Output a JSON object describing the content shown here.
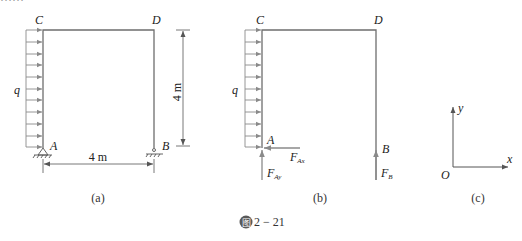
{
  "figure": {
    "caption_number": "2 − 21",
    "caption_badge": "图",
    "top_text_cropped": "……"
  },
  "panel_a": {
    "label": "(a)",
    "nodes": {
      "C": "C",
      "D": "D",
      "A": "A",
      "B": "B"
    },
    "load_label": "q",
    "height_dim": "4 m",
    "width_dim": "4 m"
  },
  "panel_b": {
    "label": "(b)",
    "nodes": {
      "C": "C",
      "D": "D",
      "A": "A",
      "B": "B"
    },
    "load_label": "q",
    "forces": {
      "F_Ax": {
        "base": "F",
        "sub": "Ax"
      },
      "F_Ay": {
        "base": "F",
        "sub": "Ay"
      },
      "F_B": {
        "base": "F",
        "sub": "B"
      }
    }
  },
  "panel_c": {
    "label": "(c)",
    "axes": {
      "x": "x",
      "y": "y",
      "origin": "O"
    }
  },
  "colors": {
    "frame": "#6e6e6e",
    "load_arrows": "#8a8a8a",
    "text": "#222222"
  }
}
